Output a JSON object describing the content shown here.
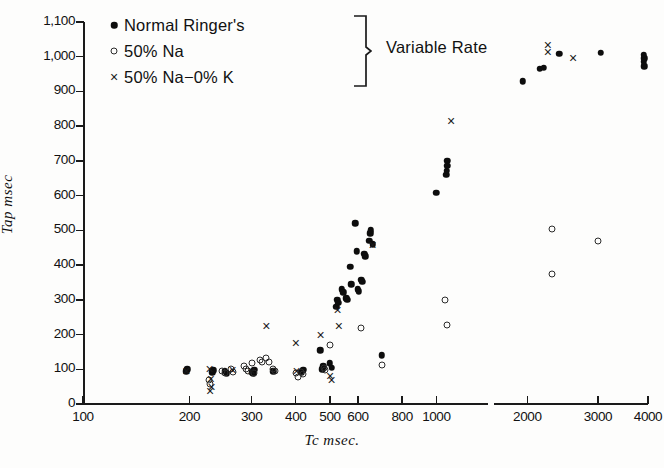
{
  "chart_data": {
    "type": "scatter",
    "title": "",
    "xlabel": "Tc  msec.",
    "ylabel": "Tap  msec",
    "xscale": "log",
    "xlim": [
      100,
      4000
    ],
    "ylim": [
      0,
      1100
    ],
    "yticks": [
      0,
      100,
      200,
      300,
      400,
      500,
      600,
      700,
      800,
      900,
      1000,
      1100
    ],
    "ytick_labels": [
      "0",
      "100",
      "200",
      "300",
      "400",
      "500",
      "600",
      "700",
      "800",
      "900",
      "1,000",
      "1,100"
    ],
    "xticks": [
      100,
      200,
      300,
      400,
      500,
      600,
      800,
      1000,
      2000,
      3000,
      4000
    ],
    "xtick_labels": [
      "100",
      "200",
      "300",
      "400",
      "500",
      "600",
      "800",
      "1000",
      "2000",
      "3000",
      "4000"
    ],
    "grid": false,
    "axis_break_after": 1400,
    "legend_position": "top-left",
    "legend_group_label": "Variable Rate",
    "series": [
      {
        "name": "Normal Ringer's",
        "marker": "filled-dot",
        "color": "#0d0d0d",
        "points": [
          [
            196,
            95
          ],
          [
            197,
            100
          ],
          [
            232,
            92
          ],
          [
            234,
            97
          ],
          [
            252,
            95
          ],
          [
            255,
            88
          ],
          [
            300,
            92
          ],
          [
            305,
            98
          ],
          [
            303,
            88
          ],
          [
            345,
            95
          ],
          [
            415,
            92
          ],
          [
            420,
            98
          ],
          [
            470,
            155
          ],
          [
            475,
            100
          ],
          [
            478,
            108
          ],
          [
            500,
            118
          ],
          [
            505,
            105
          ],
          [
            520,
            280
          ],
          [
            524,
            300
          ],
          [
            528,
            292
          ],
          [
            540,
            330
          ],
          [
            545,
            322
          ],
          [
            556,
            305
          ],
          [
            560,
            300
          ],
          [
            570,
            395
          ],
          [
            575,
            345
          ],
          [
            590,
            520
          ],
          [
            596,
            440
          ],
          [
            600,
            330
          ],
          [
            604,
            325
          ],
          [
            612,
            358
          ],
          [
            616,
            352
          ],
          [
            625,
            432
          ],
          [
            630,
            425
          ],
          [
            645,
            470
          ],
          [
            650,
            492
          ],
          [
            652,
            500
          ],
          [
            660,
            460
          ],
          [
            700,
            140
          ],
          [
            1000,
            608
          ],
          [
            1065,
            660
          ],
          [
            1070,
            672
          ],
          [
            1072,
            686
          ],
          [
            1075,
            700
          ],
          [
            1950,
            930
          ],
          [
            2150,
            965
          ],
          [
            2200,
            968
          ],
          [
            2400,
            1008
          ],
          [
            3050,
            1012
          ],
          [
            3900,
            985
          ],
          [
            3910,
            995
          ],
          [
            3905,
            1005
          ],
          [
            3915,
            972
          ]
        ]
      },
      {
        "name": "50% Na",
        "marker": "open-circle",
        "color": "#2b2b2b",
        "points": [
          [
            228,
            70
          ],
          [
            229,
            58
          ],
          [
            248,
            95
          ],
          [
            252,
            88
          ],
          [
            262,
            100
          ],
          [
            266,
            92
          ],
          [
            285,
            110
          ],
          [
            290,
            102
          ],
          [
            293,
            95
          ],
          [
            300,
            118
          ],
          [
            305,
            88
          ],
          [
            316,
            128
          ],
          [
            320,
            120
          ],
          [
            330,
            132
          ],
          [
            336,
            122
          ],
          [
            345,
            100
          ],
          [
            350,
            95
          ],
          [
            400,
            88
          ],
          [
            405,
            78
          ],
          [
            415,
            92
          ],
          [
            420,
            85
          ],
          [
            480,
            105
          ],
          [
            485,
            98
          ],
          [
            500,
            170
          ],
          [
            610,
            218
          ],
          [
            700,
            112
          ],
          [
            1060,
            300
          ],
          [
            1070,
            228
          ],
          [
            2300,
            505
          ],
          [
            2310,
            375
          ],
          [
            3000,
            470
          ]
        ]
      },
      {
        "name": "50% Na−0% K",
        "marker": "cross",
        "color": "#1a1a1a",
        "points": [
          [
            196,
            96
          ],
          [
            228,
            100
          ],
          [
            230,
            72
          ],
          [
            231,
            50
          ],
          [
            229,
            36
          ],
          [
            265,
            98
          ],
          [
            300,
            96
          ],
          [
            330,
            225
          ],
          [
            400,
            175
          ],
          [
            402,
            95
          ],
          [
            470,
            200
          ],
          [
            500,
            80
          ],
          [
            505,
            70
          ],
          [
            525,
            270
          ],
          [
            530,
            225
          ],
          [
            660,
            458
          ],
          [
            1100,
            815
          ],
          [
            2250,
            1015
          ],
          [
            2250,
            1035
          ],
          [
            2600,
            995
          ]
        ]
      }
    ]
  },
  "legend": {
    "items": [
      {
        "label": "Normal Ringer's",
        "marker": "filled-dot"
      },
      {
        "label": "50% Na",
        "marker": "open-circle"
      },
      {
        "label": "50% Na−0% K",
        "marker": "cross"
      }
    ],
    "group_label": "Variable Rate"
  }
}
